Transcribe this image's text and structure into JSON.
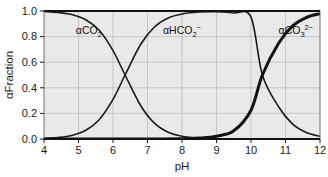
{
  "chart_data": {
    "type": "line",
    "title": "",
    "subtitle": "",
    "xlabel": "pH",
    "ylabel": "αFraction",
    "xlim": [
      4,
      12
    ],
    "ylim": [
      0.0,
      1.0
    ],
    "xticks": [
      "4",
      "5",
      "6",
      "7",
      "8",
      "9",
      "10",
      "11",
      "12"
    ],
    "xtick_values": [
      4,
      5,
      6,
      7,
      8,
      9,
      10,
      11,
      12
    ],
    "yticks": [
      "0.0",
      "0.2",
      "0.4",
      "0.6",
      "0.8",
      "1.0"
    ],
    "ytick_values": [
      0.0,
      0.2,
      0.4,
      0.6,
      0.8,
      1.0
    ],
    "grid": true,
    "grid_color": "#b9b9b9",
    "plot_bgcolor": "#e9e9e9",
    "legend_position": "inline-annotations",
    "pKa1": 6.35,
    "pKa2": 10.33,
    "series": [
      {
        "name": "αCO2",
        "label_text": "αCO",
        "label_sub": "2",
        "label_sup": "",
        "color": "#1a1a1a",
        "line_width": 1.6,
        "label_x": 5.3,
        "label_y": 0.82,
        "x": [
          4.0,
          4.4,
          4.8,
          5.2,
          5.6,
          6.0,
          6.35,
          6.8,
          7.2,
          7.6,
          8.0,
          8.5,
          9.0,
          9.5,
          10.0,
          10.5,
          11.0,
          11.5,
          12.0
        ],
        "values": [
          0.996,
          0.989,
          0.973,
          0.934,
          0.849,
          0.691,
          0.5,
          0.262,
          0.124,
          0.053,
          0.022,
          0.007,
          0.002,
          0.0007,
          0.0002,
          0.0001,
          0.0,
          0.0,
          0.0
        ]
      },
      {
        "name": "αHCO2-",
        "label_text": "αHCO",
        "label_sub": "2",
        "label_sup": "−",
        "color": "#1a1a1a",
        "line_width": 1.6,
        "label_x": 8.0,
        "label_y": 0.82,
        "x": [
          4.0,
          4.4,
          4.8,
          5.2,
          5.6,
          6.0,
          6.35,
          6.8,
          7.2,
          7.6,
          8.0,
          8.5,
          9.0,
          9.5,
          10.0,
          10.33,
          10.8,
          11.2,
          11.6,
          12.0
        ],
        "values": [
          0.004,
          0.011,
          0.027,
          0.066,
          0.151,
          0.309,
          0.5,
          0.738,
          0.875,
          0.946,
          0.977,
          0.992,
          0.995,
          0.985,
          0.952,
          0.5,
          0.252,
          0.118,
          0.051,
          0.021
        ]
      },
      {
        "name": "αCO3 2-",
        "label_text": "αCO",
        "label_sub": "3",
        "label_sup": "2−",
        "color": "#121212",
        "line_width": 3.0,
        "label_x": 11.3,
        "label_y": 0.82,
        "x": [
          4.0,
          5.0,
          6.0,
          7.0,
          8.0,
          8.5,
          9.0,
          9.5,
          10.0,
          10.33,
          10.8,
          11.2,
          11.6,
          12.0
        ],
        "values": [
          0.0,
          0.0,
          0.0,
          0.0003,
          0.001,
          0.007,
          0.022,
          0.064,
          0.225,
          0.5,
          0.748,
          0.882,
          0.949,
          0.979
        ]
      }
    ]
  },
  "caption": {
    "partial_text": ""
  }
}
